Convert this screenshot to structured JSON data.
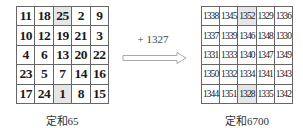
{
  "left_square": {
    "rows": [
      [
        "11",
        "18",
        "25",
        "2",
        "9"
      ],
      [
        "10",
        "12",
        "19",
        "21",
        "3"
      ],
      [
        "4",
        "6",
        "13",
        "20",
        "22"
      ],
      [
        "23",
        "5",
        "7",
        "14",
        "16"
      ],
      [
        "17",
        "24",
        "1",
        "8",
        "15"
      ]
    ],
    "caption": "定和65"
  },
  "operation": {
    "label": "+ 1327",
    "icon": "hollow-right-arrow"
  },
  "right_square": {
    "rows": [
      [
        "1338",
        "1345",
        "1352",
        "1329",
        "1336"
      ],
      [
        "1337",
        "1339",
        "1346",
        "1348",
        "1330"
      ],
      [
        "1331",
        "1333",
        "1340",
        "1347",
        "1349"
      ],
      [
        "1350",
        "1332",
        "1334",
        "1341",
        "1343"
      ],
      [
        "1344",
        "1351",
        "1328",
        "1335",
        "1342"
      ]
    ],
    "caption": "定和6700"
  },
  "colors": {
    "shade": "#e6e6e6",
    "border": "#666666",
    "arrow": "#aaaaaa"
  }
}
